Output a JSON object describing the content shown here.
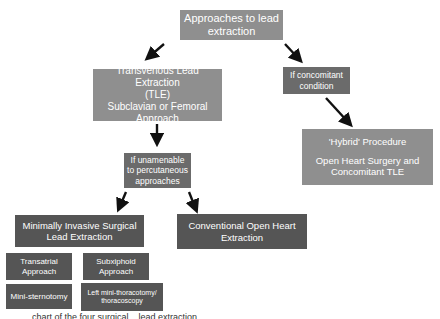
{
  "title": {
    "line1": "Approaches to lead",
    "line2": "extraction"
  },
  "tle": {
    "line1": "Transvenous Lead Extraction",
    "line2": "(TLE)",
    "line3": "Subclavian or Femoral",
    "line4": "Approach"
  },
  "concomitant": {
    "line1": "If concomitant",
    "line2": "condition"
  },
  "hybrid": {
    "title": "'Hybrid' Procedure",
    "line1": "Open Heart Surgery and",
    "line2": "Concomitant TLE"
  },
  "unamenable": {
    "line1": "If unamenable",
    "line2": "to percutaneous",
    "line3": "approaches"
  },
  "minimally_invasive": {
    "line1": "Minimally Invasive Surgical",
    "line2": "Lead Extraction"
  },
  "conventional": {
    "line1": "Conventional Open Heart",
    "line2": "Extraction"
  },
  "sub_approaches": [
    {
      "line1": "Transatrial",
      "line2": "Approach"
    },
    {
      "line1": "Subxiphoid",
      "line2": "Approach"
    },
    {
      "line1": "Mini-sternotomy",
      "line2": ""
    },
    {
      "line1": "Left mini-thoracotomy/",
      "line2": "thoracoscopy"
    }
  ],
  "caption": "... chart of the four surgical... lead extraction",
  "colors": {
    "light_box": "#8f8f8f",
    "mid_box": "#6b6b6b",
    "dark_box": "#555555",
    "arrow": "#111111"
  }
}
